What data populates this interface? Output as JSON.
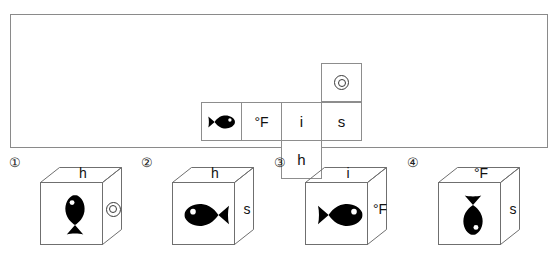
{
  "puzzle": {
    "type": "cube-net-folding",
    "net": {
      "description": "Unfolded cube net: four cells in a row, one cell above the fourth, one cell below the third.",
      "cells": [
        {
          "id": "net-cell-fish",
          "position": "row1-col1",
          "content_type": "fish-icon",
          "label": "",
          "fish_direction": "left"
        },
        {
          "id": "net-cell-degf",
          "position": "row1-col2",
          "content_type": "text",
          "label": "°F"
        },
        {
          "id": "net-cell-i",
          "position": "row1-col3",
          "content_type": "text",
          "label": "i"
        },
        {
          "id": "net-cell-s",
          "position": "row1-col4",
          "content_type": "text",
          "label": "s"
        },
        {
          "id": "net-cell-circle",
          "position": "above-col4",
          "content_type": "double-circle-icon",
          "label": ""
        },
        {
          "id": "net-cell-h",
          "position": "below-col3",
          "content_type": "text",
          "label": "h"
        }
      ]
    },
    "options": [
      {
        "number": "①",
        "top_label": "h",
        "right_label": "",
        "right_content_type": "double-circle-icon",
        "front_content_type": "fish-icon",
        "fish_rotation_deg": -90,
        "fish_direction": "up"
      },
      {
        "number": "②",
        "top_label": "h",
        "right_label": "s",
        "right_content_type": "text",
        "front_content_type": "fish-icon",
        "fish_rotation_deg": 180,
        "fish_direction": "right"
      },
      {
        "number": "③",
        "top_label": "i",
        "right_label": "°F",
        "right_content_type": "text",
        "front_content_type": "fish-icon",
        "fish_rotation_deg": 0,
        "fish_direction": "left"
      },
      {
        "number": "④",
        "top_label": "°F",
        "right_label": "s",
        "right_content_type": "text",
        "front_content_type": "fish-icon",
        "fish_rotation_deg": 90,
        "fish_direction": "down"
      }
    ]
  },
  "colors": {
    "line": "#8d8d8d",
    "frame": "#8a8a8a",
    "ink": "#111111",
    "fish": "#000000",
    "background": "#ffffff"
  }
}
